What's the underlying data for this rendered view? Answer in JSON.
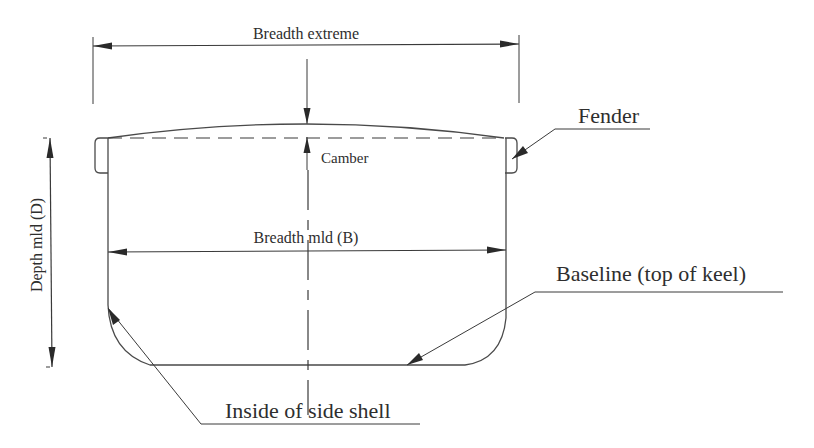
{
  "labels": {
    "breadth_extreme": "Breadth extreme",
    "camber": "Camber",
    "fender": "Fender",
    "depth_mld": "Depth mld (D)",
    "breadth_mld": "Breadth mld (B)",
    "baseline": "Baseline (top of keel)",
    "inside_side_shell": "Inside of side shell"
  },
  "colors": {
    "line": "#3a3a3a",
    "text": "#2e2e2e",
    "background": "#ffffff"
  }
}
